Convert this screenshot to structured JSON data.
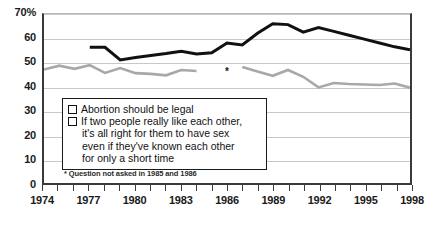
{
  "chart_data": {
    "type": "line",
    "title": "",
    "subtitle": "",
    "xlabel": "",
    "ylabel": "",
    "xlim": [
      1974,
      1998
    ],
    "ylim": [
      0,
      70
    ],
    "grid": true,
    "legend_position": "inside-lower-left",
    "y_ticks": [
      "70%",
      "60",
      "50",
      "40",
      "30",
      "20",
      "10",
      "0"
    ],
    "y_tick_values": [
      70,
      60,
      50,
      40,
      30,
      20,
      10,
      0
    ],
    "x_ticks": [
      "1974",
      "1977",
      "1980",
      "1983",
      "1986",
      "1989",
      "1992",
      "1995",
      "1998"
    ],
    "x_tick_values": [
      1974,
      1977,
      1980,
      1983,
      1986,
      1989,
      1992,
      1995,
      1998
    ],
    "x_minor_ticks": [
      1974,
      1975,
      1976,
      1977,
      1978,
      1979,
      1980,
      1981,
      1982,
      1983,
      1984,
      1985,
      1986,
      1987,
      1988,
      1989,
      1990,
      1991,
      1992,
      1993,
      1994,
      1995,
      1996,
      1997,
      1998
    ],
    "annotations": [
      {
        "text": "*",
        "x": 1986,
        "y": 47.5,
        "note": "marks years question was not asked"
      }
    ],
    "footnote": "* Question not asked in 1985 and 1986",
    "series": [
      {
        "name": "Abortion should be legal",
        "color": "#111111",
        "width": 3,
        "x": [
          1977,
          1978,
          1979,
          1980,
          1981,
          1982,
          1983,
          1984,
          1985,
          1986,
          1987,
          1988,
          1989,
          1990,
          1991,
          1992,
          1993,
          1994,
          1995,
          1996,
          1997,
          1998
        ],
        "values": [
          56.2,
          56.2,
          51.0,
          52.0,
          52.8,
          53.6,
          54.6,
          53.4,
          53.9,
          58.0,
          57.2,
          62.0,
          66.0,
          65.6,
          62.5,
          64.4,
          62.8,
          61.2,
          59.6,
          58.0,
          56.4,
          55.2
        ]
      },
      {
        "name": "If two people really like each other, it's all right for them to have sex even if they've known each other for only a short time",
        "color": "#a8a8a8",
        "width": 2.6,
        "segments": [
          {
            "x": [
              1974,
              1975,
              1976,
              1977,
              1978,
              1979,
              1980,
              1981,
              1982,
              1983,
              1984
            ],
            "values": [
              47.0,
              48.6,
              47.3,
              48.8,
              45.6,
              47.6,
              45.5,
              45.2,
              44.6,
              46.8,
              46.4
            ]
          },
          {
            "x": [
              1987,
              1988,
              1989,
              1990,
              1991,
              1992,
              1993,
              1994,
              1995,
              1996,
              1997,
              1998
            ],
            "values": [
              48.0,
              46.2,
              44.4,
              46.8,
              44.0,
              39.6,
              41.4,
              41.0,
              40.8,
              40.6,
              41.2,
              39.5
            ]
          }
        ]
      }
    ]
  },
  "legend": {
    "items": [
      {
        "swatch_color": "#111111",
        "label": "Abortion should be legal"
      },
      {
        "swatch_color": "#a8a8a8",
        "label": "If two people really like each other,"
      }
    ],
    "continuation_lines": [
      "it's all right for them to have sex",
      "even if they've known each other",
      "for only a short time"
    ]
  },
  "footnote": {
    "text": "* Question not asked in 1985 and 1986"
  },
  "asterisk": {
    "glyph": "*"
  }
}
